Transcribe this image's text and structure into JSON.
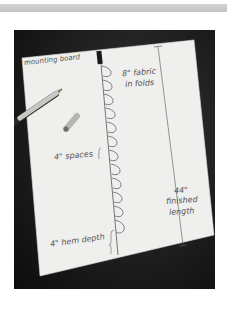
{
  "image": {
    "description": "Photo of a hand-drawn diagram on a sheet of paper showing a fabric shade measurement, with a pen and pen cap",
    "labels": {
      "mounting_board": "mounting board",
      "fabric_folds_1": "8\" fabric",
      "fabric_folds_2": "in folds",
      "spaces": "4\" spaces",
      "length_1": "44\"",
      "length_2": "finished",
      "length_3": "length",
      "hem_depth": "4\" hem depth"
    },
    "colors": {
      "background": "#1a1a1a",
      "paper": "#efefed",
      "ink": "#555555",
      "pen": "#c9c9c9"
    }
  }
}
